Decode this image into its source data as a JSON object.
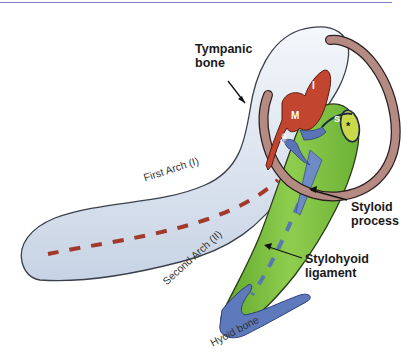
{
  "figure": {
    "labels": {
      "tympanic_bone": [
        "Tympanic",
        "bone"
      ],
      "first_arch": "First Arch (I)",
      "second_arch": "Second Arch (II)",
      "styloid_process": [
        "Styloid",
        "process"
      ],
      "stylohyoid_ligament": [
        "Stylohyoid",
        "ligament"
      ],
      "hyoid_bone": "Hyoid bone",
      "malleus": "M",
      "incus": "I",
      "stapes": "S",
      "anterior_process": "AP",
      "asterisk": "*"
    },
    "colors": {
      "first_arch": "#dfe7f2",
      "second_arch": "#7fc241",
      "tympanic_ring": "#b58a82",
      "ossicles_red": "#c2452f",
      "blue_structures": "#5b74b8",
      "first_arch_dash": "#a23a2c",
      "second_arch_dash": "#5878b4",
      "top_rule": "#7b7fc4"
    }
  }
}
